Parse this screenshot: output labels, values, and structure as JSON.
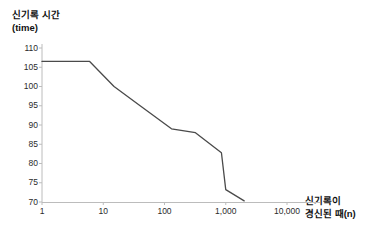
{
  "chart_data": {
    "type": "line",
    "title": "",
    "ylabel": "신기록 시간",
    "ylabel_unit": "(time)",
    "xlabel": "신기록이",
    "xlabel_unit": "경신된 때(n)",
    "xscale": "log",
    "xlim": [
      1,
      10000
    ],
    "ylim": [
      70,
      110
    ],
    "grid": false,
    "legend": null,
    "xticklabels": [
      "1",
      "10",
      "100",
      "1,000",
      "10,000"
    ],
    "xtickvalues": [
      1,
      10,
      100,
      1000,
      10000
    ],
    "yticklabels": [
      "110",
      "105",
      "100",
      "95",
      "90",
      "85",
      "80",
      "75",
      "70"
    ],
    "ytickvalues": [
      110,
      105,
      100,
      95,
      90,
      85,
      80,
      75,
      70
    ],
    "series": [
      {
        "name": "record time",
        "color": "#4a4a4a",
        "points": [
          [
            1,
            106.5
          ],
          [
            6,
            106.5
          ],
          [
            15,
            100.0
          ],
          [
            40,
            95.0
          ],
          [
            130,
            89.0
          ],
          [
            320,
            88.0
          ],
          [
            850,
            82.8
          ],
          [
            1000,
            73.2
          ],
          [
            2000,
            70.3
          ]
        ]
      }
    ]
  },
  "axes": {
    "line_color": "#bcbcbc",
    "tick_color": "#bcbcbc"
  }
}
